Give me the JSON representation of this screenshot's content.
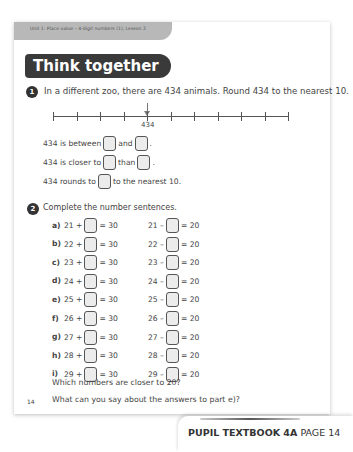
{
  "header": {
    "unit_label": "Unit 1: Place value – 4-digit numbers (1), Lesson 2",
    "section_title": "Think together"
  },
  "question1": {
    "number": "1",
    "prompt": "In a different zoo, there are 434 animals. Round 434 to the nearest 10.",
    "number_line": {
      "tick_count": 11,
      "marked_value_label": "434",
      "marked_tick_index": 4
    },
    "sentences": [
      {
        "parts": [
          "434 is between",
          "and",
          "."
        ]
      },
      {
        "parts": [
          "434 is closer to",
          "than",
          "."
        ]
      },
      {
        "parts": [
          "434 rounds to",
          "to the nearest 10."
        ]
      }
    ]
  },
  "question2": {
    "number": "2",
    "prompt": "Complete the number sentences.",
    "rows": [
      {
        "label": "a)",
        "left_a": "21 +",
        "left_b": "= 30",
        "right_a": "21 –",
        "right_b": "= 20"
      },
      {
        "label": "b)",
        "left_a": "22 +",
        "left_b": "= 30",
        "right_a": "22 –",
        "right_b": "= 20"
      },
      {
        "label": "c)",
        "left_a": "23 +",
        "left_b": "= 30",
        "right_a": "23 –",
        "right_b": "= 20"
      },
      {
        "label": "d)",
        "left_a": "24 +",
        "left_b": "= 30",
        "right_a": "24 –",
        "right_b": "= 20"
      },
      {
        "label": "e)",
        "left_a": "25 +",
        "left_b": "= 30",
        "right_a": "25 –",
        "right_b": "= 20"
      },
      {
        "label": "f)",
        "left_a": "26 +",
        "left_b": "= 30",
        "right_a": "26 –",
        "right_b": "= 20"
      },
      {
        "label": "g)",
        "left_a": "27 +",
        "left_b": "= 30",
        "right_a": "27 –",
        "right_b": "= 20"
      },
      {
        "label": "h)",
        "left_a": "28 +",
        "left_b": "= 30",
        "right_a": "28 –",
        "right_b": "= 20"
      },
      {
        "label": "i)",
        "left_a": "29 +",
        "left_b": "= 30",
        "right_a": "29 –",
        "right_b": "= 20"
      }
    ],
    "followup_1": "Which numbers are closer to 20?",
    "followup_2": "What can you say about the answers to part e)?"
  },
  "page_number": "14",
  "footer": {
    "book": "PUPIL TEXTBOOK 4A",
    "page": "PAGE 14"
  },
  "colors": {
    "title_bg": "#3a3a3a",
    "unit_bar_bg": "#b8b8b8",
    "badge_bg": "#333333",
    "answer_box_bg": "#ececec"
  }
}
